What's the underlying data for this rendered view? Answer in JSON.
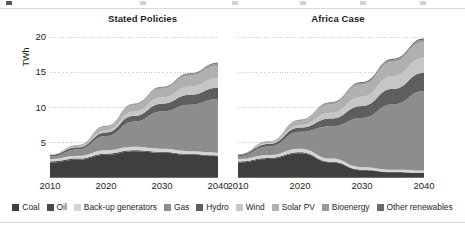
{
  "figure": {
    "unit_label": "TWh"
  },
  "panels": [
    {
      "title": "Stated Policies"
    },
    {
      "title": "Africa Case"
    }
  ],
  "legend": {
    "items": [
      {
        "label": "Coal",
        "color": "#3f3f3f"
      },
      {
        "label": "Oil",
        "color": "#4a4a4a"
      },
      {
        "label": "Back-up generators",
        "color": "#d4d4d4"
      },
      {
        "label": "Gas",
        "color": "#8d8d8d"
      },
      {
        "label": "Hydro",
        "color": "#5e5e5e"
      },
      {
        "label": "Wind",
        "color": "#c6c6c6"
      },
      {
        "label": "Solar PV",
        "color": "#b0b0b0"
      },
      {
        "label": "Bioenergy",
        "color": "#9a9a9a"
      },
      {
        "label": "Other renewables",
        "color": "#6a6a6a"
      }
    ]
  },
  "chart_data": {
    "type": "area",
    "title": "",
    "xlabel": "",
    "ylabel": "TWh",
    "ylim": [
      0,
      21
    ],
    "yticks": [
      5,
      10,
      15,
      20
    ],
    "grid": true,
    "legend_position": "bottom",
    "x": [
      2010,
      2015,
      2020,
      2025,
      2030,
      2035,
      2040
    ],
    "xticks": [
      2010,
      2020,
      2030,
      2040
    ],
    "panels": [
      {
        "title": "Stated Policies",
        "series": [
          {
            "name": "Coal",
            "color": "#3f3f3f",
            "values": [
              2.2,
              2.6,
              3.3,
              3.8,
              3.6,
              3.3,
              3.1
            ]
          },
          {
            "name": "Oil",
            "color": "#4a4a4a",
            "values": [
              0.15,
              0.15,
              0.15,
              0.12,
              0.1,
              0.1,
              0.1
            ]
          },
          {
            "name": "Back-up generators",
            "color": "#d4d4d4",
            "values": [
              0.35,
              0.4,
              0.5,
              0.5,
              0.45,
              0.4,
              0.4
            ]
          },
          {
            "name": "Gas",
            "color": "#8d8d8d",
            "values": [
              0.35,
              0.9,
              2.0,
              3.6,
              5.3,
              6.6,
              7.6
            ]
          },
          {
            "name": "Hydro",
            "color": "#5e5e5e",
            "values": [
              0.2,
              0.3,
              0.5,
              0.8,
              1.1,
              1.4,
              1.6
            ]
          },
          {
            "name": "Wind",
            "color": "#c6c6c6",
            "values": [
              0.02,
              0.1,
              0.3,
              0.6,
              0.9,
              1.2,
              1.4
            ]
          },
          {
            "name": "Solar PV",
            "color": "#b0b0b0",
            "values": [
              0.01,
              0.15,
              0.5,
              0.9,
              1.2,
              1.5,
              1.7
            ]
          },
          {
            "name": "Bioenergy",
            "color": "#9a9a9a",
            "values": [
              0.02,
              0.05,
              0.1,
              0.15,
              0.2,
              0.25,
              0.3
            ]
          },
          {
            "name": "Other renewables",
            "color": "#6a6a6a",
            "values": [
              0.0,
              0.02,
              0.05,
              0.08,
              0.1,
              0.12,
              0.15
            ]
          }
        ],
        "total_2040": 16.3
      },
      {
        "title": "Africa Case",
        "series": [
          {
            "name": "Coal",
            "color": "#3f3f3f",
            "values": [
              2.2,
              2.7,
              3.5,
              2.2,
              1.1,
              0.8,
              0.7
            ]
          },
          {
            "name": "Oil",
            "color": "#4a4a4a",
            "values": [
              0.15,
              0.15,
              0.15,
              0.1,
              0.08,
              0.06,
              0.05
            ]
          },
          {
            "name": "Back-up generators",
            "color": "#d4d4d4",
            "values": [
              0.35,
              0.42,
              0.5,
              0.45,
              0.35,
              0.3,
              0.3
            ]
          },
          {
            "name": "Gas",
            "color": "#8d8d8d",
            "values": [
              0.4,
              1.2,
              2.4,
              4.6,
              7.0,
              9.3,
              11.3
            ]
          },
          {
            "name": "Hydro",
            "color": "#5e5e5e",
            "values": [
              0.2,
              0.35,
              0.6,
              1.1,
              1.7,
              2.2,
              2.6
            ]
          },
          {
            "name": "Wind",
            "color": "#c6c6c6",
            "values": [
              0.02,
              0.12,
              0.35,
              0.8,
              1.3,
              1.8,
              2.1
            ]
          },
          {
            "name": "Solar PV",
            "color": "#b0b0b0",
            "values": [
              0.01,
              0.18,
              0.6,
              1.2,
              1.7,
              2.0,
              2.2
            ]
          },
          {
            "name": "Bioenergy",
            "color": "#9a9a9a",
            "values": [
              0.02,
              0.06,
              0.12,
              0.2,
              0.25,
              0.3,
              0.35
            ]
          },
          {
            "name": "Other renewables",
            "color": "#6a6a6a",
            "values": [
              0.0,
              0.02,
              0.06,
              0.1,
              0.13,
              0.15,
              0.18
            ]
          }
        ],
        "total_2040": 19.8
      }
    ]
  }
}
